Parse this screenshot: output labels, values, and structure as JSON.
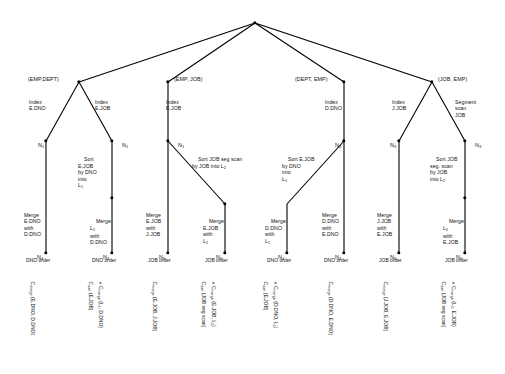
{
  "diagram": {
    "root": {
      "name": "root-node"
    },
    "branches": [
      {
        "id": "emp-dept",
        "label": "(EMP,DEPT)",
        "paths": [
          {
            "access": "Index\nE.DNO",
            "node_top": "N",
            "node_top_sub": "1",
            "operation": "Merge\nE.DNO\nwith\nD.DNO",
            "node_bottom": "N",
            "node_bottom_sub": "4",
            "order": "DNO order",
            "cost": "C",
            "cost_sub": "merge",
            "cost_args": " (E.DNO, D.DNO)"
          },
          {
            "access": "Index\nE.JOB",
            "node_top": "N",
            "node_top_sub": "1",
            "sort": "Sort\nE.JOB\nby DNO\ninto\nL",
            "sort_sub": "1",
            "operation": "Merge\nL",
            "operation_sub": "1",
            "operation_rest": "\nwith\nD.DNO",
            "node_bottom": "N",
            "node_bottom_sub": "4",
            "order": "DNO order",
            "cost": "C",
            "cost_sub": "sort",
            "cost_args": " (E.JOB)",
            "cost2": "C",
            "cost2_sub": "merge",
            "cost2_args": " (L₁, D.DNO)"
          }
        ]
      },
      {
        "id": "emp-job",
        "label": "(EMP, JOB)",
        "paths": [
          {
            "access": "Index\nE.JOB",
            "node_top": "N",
            "node_top_sub": "1",
            "operation": "Merge\nE.JOB\nwith\nJ.JOB",
            "node_bottom": "N",
            "node_bottom_sub": "5",
            "order": "JOB order",
            "cost": "C",
            "cost_sub": "merge",
            "cost_args": " (E.JOB, J.JOB)"
          },
          {
            "access": "Sort JOB seg scan\nby JOB into L",
            "access_sub": "2",
            "operation": "Merge\nE.JOB\nwith\nL",
            "operation_sub": "2",
            "node_bottom": "N",
            "node_bottom_sub": "5",
            "order": "JOB order",
            "cost": "C",
            "cost_sub": "sort",
            "cost_args": " (JOB seg scan)",
            "cost2": "C",
            "cost2_sub": "merge",
            "cost2_args": " (E.JOB, L₂)"
          }
        ]
      },
      {
        "id": "dept-emp",
        "label": "(DEPT, EMP)",
        "paths": [
          {
            "access": "Index\nD.DNO",
            "node_top": "N",
            "node_top_sub": "2",
            "sort": "Sort E.JOB\nby DNO\ninto\nL",
            "sort_sub": "1",
            "operation": "Merge\nD.DNO\nwith\nL",
            "operation_sub": "1",
            "node_bottom": "N",
            "node_bottom_sub": "4",
            "order": "DNO order",
            "cost": "C",
            "cost_sub": "sort",
            "cost_args": " (E.JOB)",
            "cost2": "C",
            "cost2_sub": "merge",
            "cost2_args": " (D.DNO, L₁)"
          },
          {
            "operation": "Merge\nD.DNO\nwith\nE.DNO",
            "node_bottom": "N",
            "node_bottom_sub": "4",
            "order": "DNO order",
            "cost": "C",
            "cost_sub": "merge",
            "cost_args": " (D.DNO, E.DNO)"
          }
        ]
      },
      {
        "id": "job-emp",
        "label": "(JOB, EMP)",
        "paths": [
          {
            "access": "Index\nJ.JOB",
            "node_top": "N",
            "node_top_sub": "3",
            "operation": "Merge\nJ.JOB\nwith\nE.JOB",
            "node_bottom": "N",
            "node_bottom_sub": "5",
            "order": "JOB order",
            "cost": "C",
            "cost_sub": "merge",
            "cost_args": " (J.JOB, E.JOB)"
          },
          {
            "access": "Segment\nscan\nJOB",
            "node_top": "N",
            "node_top_sub": "3",
            "sort": "Sort JOB\nseg. scan\nby JOB\ninto L",
            "sort_sub": "2",
            "operation": "Merge\nL",
            "operation_sub": "2",
            "operation_rest": "\nwith\nE.JOB",
            "node_bottom": "N",
            "node_bottom_sub": "5",
            "order": "JOB order",
            "cost": "C",
            "cost_sub": "sort",
            "cost_args": " (JOB seg scan)",
            "cost2": "C",
            "cost2_sub": "merge",
            "cost2_args": " (L₂, E.JOB)"
          }
        ]
      }
    ],
    "colors": {
      "line": "#000000",
      "node": "#000000",
      "background": "#ffffff"
    }
  }
}
